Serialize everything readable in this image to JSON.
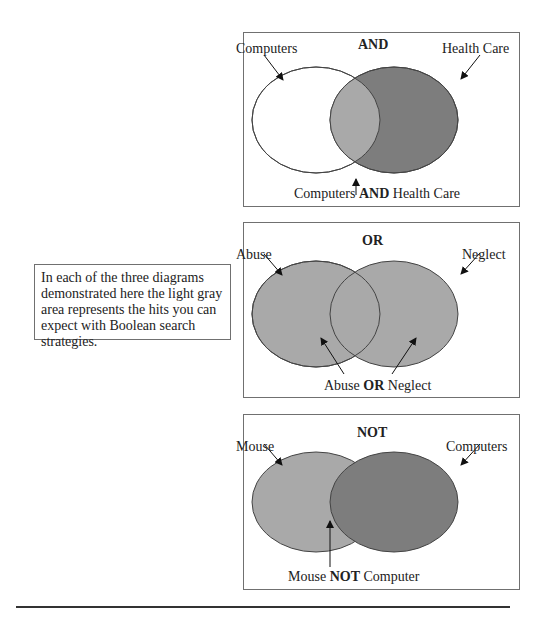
{
  "note": {
    "text": "In each of the three diagrams demonstrated here the light gray area represents the hits you can expect with Boolean search strategies."
  },
  "colors": {
    "light_gray": "#a9a9a9",
    "dark_gray": "#7d7d7d",
    "white": "#ffffff",
    "outline": "#444444"
  },
  "diagrams": [
    {
      "operator": "AND",
      "left_label": "Computers",
      "right_label": "Health Care",
      "caption_pre": "Computers ",
      "caption_op": "AND",
      "caption_post": " Health Care"
    },
    {
      "operator": "OR",
      "left_label": "Abuse",
      "right_label": "Neglect",
      "caption_pre": "Abuse ",
      "caption_op": "OR",
      "caption_post": " Neglect"
    },
    {
      "operator": "NOT",
      "left_label": "Mouse",
      "right_label": "Computers",
      "caption_pre": "Mouse ",
      "caption_op": "NOT",
      "caption_post": " Computer"
    }
  ]
}
